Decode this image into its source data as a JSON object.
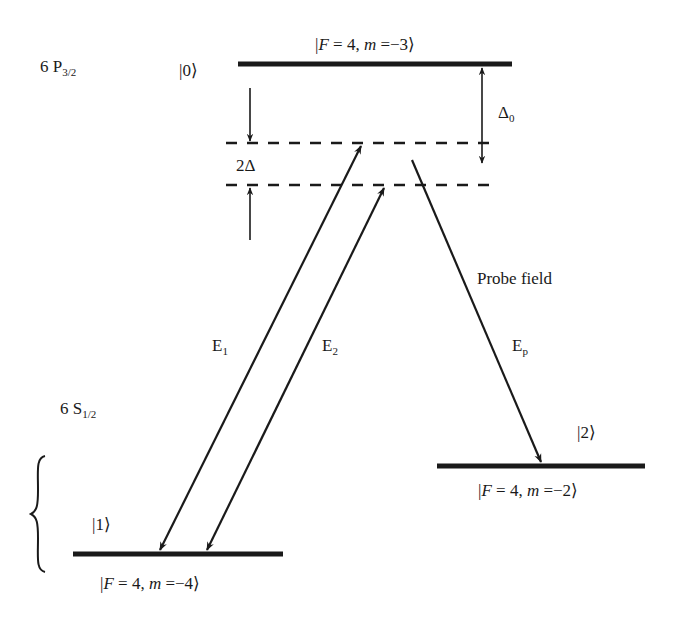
{
  "diagram": {
    "type": "energy-level-diagram",
    "colors": {
      "line": "#1a1a1a",
      "background": "#ffffff"
    },
    "manifolds": {
      "excited": {
        "name": "6 P",
        "sub": "3/2"
      },
      "ground": {
        "name": "6 S",
        "sub": "1/2"
      }
    },
    "levels": [
      {
        "id": "0",
        "ket": "|0⟩",
        "state_prefix": "|",
        "F_label": "F",
        "F_value": " = 4, ",
        "m_label": "m",
        "m_value": " =−3⟩"
      },
      {
        "id": "1",
        "ket": "|1⟩",
        "state_prefix": "|",
        "F_label": "F",
        "F_value": " = 4, ",
        "m_label": "m",
        "m_value": " =−4⟩"
      },
      {
        "id": "2",
        "ket": "|2⟩",
        "state_prefix": "|",
        "F_label": "F",
        "F_value": " = 4, ",
        "m_label": "m",
        "m_value": " =−2⟩"
      }
    ],
    "detunings": {
      "delta0": {
        "symbol": "Δ",
        "sub": "0"
      },
      "two_delta": "2Δ"
    },
    "fields": {
      "E1": {
        "symbol": "E",
        "sub": "1"
      },
      "E2": {
        "symbol": "E",
        "sub": "2"
      },
      "Ep": {
        "symbol": "E",
        "sub": "p"
      },
      "probe_label": "Probe field"
    }
  }
}
